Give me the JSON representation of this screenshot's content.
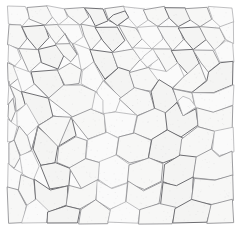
{
  "figure": {
    "kind": "micrograph",
    "name": "grain-structure-micrograph",
    "subject_label": "polycrystalline grain boundary network",
    "width_px": 241,
    "height_px": 234,
    "has_axes": false,
    "has_text_labels": false,
    "has_scale_bar": false,
    "colors": {
      "page_background": "#ffffff",
      "plate_background": "#fbfbfb",
      "cell_interior": "#f7f7f6",
      "cell_interior_pale": "#fafafa",
      "cell_interior_dark": "#f4f4f3",
      "boundary_line": "#8d8d90",
      "boundary_line_pale": "#a6a6a9",
      "boundary_line_dark": "#6e6e72"
    },
    "content_bounds": {
      "left": 8,
      "top": 7,
      "right": 233,
      "bottom": 223
    },
    "margin_px": {
      "left": 8,
      "top": 7,
      "right": 8,
      "bottom": 11
    }
  },
  "chart_data": {
    "type": "heatmap",
    "title": "",
    "subtitle": "",
    "xlabel": "",
    "ylabel": "",
    "grid": false,
    "legend_position": "none",
    "xlim": [
      0,
      241
    ],
    "ylim": [
      0,
      234
    ],
    "cell_count_estimate": 142,
    "mean_cell_diameter_px": 19,
    "boundary_stroke_width_px": 0.85,
    "cells": [
      {
        "tone": "pale",
        "pts": "8,7 26,7 30,18 22,26 9,24"
      },
      {
        "tone": "mid",
        "pts": "26,7 46,6 52,16 44,25 30,18"
      },
      {
        "tone": "pale",
        "pts": "46,6 64,8 68,17 58,24 52,16"
      },
      {
        "tone": "mid",
        "pts": "64,8 84,7 90,16 80,25 68,17"
      },
      {
        "tone": "dark",
        "pts": "84,7 104,8 108,20 96,27 90,16"
      },
      {
        "tone": "mid",
        "pts": "104,8 124,7 128,18 118,26 108,20"
      },
      {
        "tone": "pale",
        "pts": "124,7 144,9 148,20 136,27 128,18"
      },
      {
        "tone": "mid",
        "pts": "144,9 164,7 170,18 158,26 148,20"
      },
      {
        "tone": "dark",
        "pts": "164,7 186,8 190,19 178,27 170,18"
      },
      {
        "tone": "mid",
        "pts": "186,8 208,7 212,19 200,27 190,19"
      },
      {
        "tone": "pale",
        "pts": "208,7 233,8 233,22 220,28 212,19"
      },
      {
        "tone": "mid",
        "pts": "9,24 22,26 26,38 18,48 8,44"
      },
      {
        "tone": "dark",
        "pts": "22,26 44,25 50,38 38,50 26,38"
      },
      {
        "tone": "mid",
        "pts": "44,25 58,24 64,34 56,44 50,38"
      },
      {
        "tone": "pale",
        "pts": "58,24 80,25 84,36 72,44 64,34"
      },
      {
        "tone": "mid",
        "pts": "80,25 96,27 102,40 90,50 84,36"
      },
      {
        "tone": "dark",
        "pts": "96,27 118,26 126,40 112,52 102,40"
      },
      {
        "tone": "mid",
        "pts": "118,26 136,27 142,38 132,48 126,40"
      },
      {
        "tone": "pale",
        "pts": "136,27 158,26 164,38 152,48 142,38"
      },
      {
        "tone": "mid",
        "pts": "158,26 178,27 184,40 172,50 164,38"
      },
      {
        "tone": "dark",
        "pts": "178,27 200,27 206,40 194,50 184,40"
      },
      {
        "tone": "mid",
        "pts": "200,27 220,28 226,40 214,50 206,40"
      },
      {
        "tone": "pale",
        "pts": "220,28 233,22 233,44 226,40"
      },
      {
        "tone": "pale",
        "pts": "8,44 18,48 22,58 14,66 8,62"
      },
      {
        "tone": "mid",
        "pts": "18,48 38,50 42,62 30,72 22,58"
      },
      {
        "tone": "dark",
        "pts": "38,50 56,44 64,56 58,70 42,62"
      },
      {
        "tone": "mid",
        "pts": "56,44 72,44 78,54 70,62 64,56"
      },
      {
        "tone": "pale",
        "pts": "72,44 90,50 94,62 82,70 78,54"
      },
      {
        "tone": "dark",
        "pts": "90,50 112,52 118,68 104,80 94,62"
      },
      {
        "tone": "mid",
        "pts": "112,52 132,48 140,60 130,72 118,68"
      },
      {
        "tone": "pale",
        "pts": "132,48 152,48 158,58 148,68 140,60"
      },
      {
        "tone": "mid",
        "pts": "152,48 172,50 178,62 166,72 158,58"
      },
      {
        "tone": "dark",
        "pts": "172,50 194,50 200,64 188,74 178,62"
      },
      {
        "tone": "mid",
        "pts": "194,50 214,50 220,62 208,72 200,64"
      },
      {
        "tone": "pale",
        "pts": "214,50 226,40 233,44 233,62 220,62"
      },
      {
        "tone": "mid",
        "pts": "8,62 14,66 18,78 10,86 8,80"
      },
      {
        "tone": "pale",
        "pts": "14,66 30,72 34,84 22,92 18,78"
      },
      {
        "tone": "dark",
        "pts": "30,72 58,70 64,86 48,98 34,84"
      },
      {
        "tone": "mid",
        "pts": "58,70 70,62 82,70 80,84 64,86"
      },
      {
        "tone": "pale",
        "pts": "80,84 82,70 94,62 104,80 96,92"
      },
      {
        "tone": "dark",
        "pts": "104,80 118,68 130,72 134,88 120,98"
      },
      {
        "tone": "mid",
        "pts": "130,72 148,68 158,80 150,92 134,88"
      },
      {
        "tone": "pale",
        "pts": "158,80 148,68 166,72 178,62 184,78 172,88"
      },
      {
        "tone": "mid",
        "pts": "172,88 184,78 188,74 200,64 206,80 192,92"
      },
      {
        "tone": "dark",
        "pts": "192,92 206,80 208,72 220,62 233,62 233,84 214,92"
      },
      {
        "tone": "pale",
        "pts": "8,80 10,86 14,98 8,104"
      },
      {
        "tone": "mid",
        "pts": "10,86 22,92 26,104 16,112 14,98"
      },
      {
        "tone": "dark",
        "pts": "22,92 48,98 54,116 38,126 26,104"
      },
      {
        "tone": "mid",
        "pts": "48,98 64,86 80,84 96,92 92,110 72,118"
      },
      {
        "tone": "pale",
        "pts": "96,92 104,80 120,98 116,112 104,114"
      },
      {
        "tone": "mid",
        "pts": "120,98 134,88 150,92 154,108 138,116"
      },
      {
        "tone": "dark",
        "pts": "154,108 150,92 158,80 172,88 178,102 166,114"
      },
      {
        "tone": "mid",
        "pts": "178,102 172,88 192,92 196,108 184,116"
      },
      {
        "tone": "pale",
        "pts": "196,108 192,92 214,92 233,84 233,106 214,112"
      },
      {
        "tone": "mid",
        "pts": "8,104 14,98 16,112 10,122 8,118"
      },
      {
        "tone": "pale",
        "pts": "16,112 26,104 38,126 28,136 18,126"
      },
      {
        "tone": "dark",
        "pts": "38,126 54,116 72,118 76,136 58,146"
      },
      {
        "tone": "mid",
        "pts": "72,118 92,110 104,114 106,132 88,140"
      },
      {
        "tone": "pale",
        "pts": "106,132 104,114 116,112 138,116 134,134 118,138"
      },
      {
        "tone": "mid",
        "pts": "134,134 138,116 154,108 166,114 168,130 152,140"
      },
      {
        "tone": "dark",
        "pts": "168,130 166,114 178,102 184,116 196,108 198,126 182,138"
      },
      {
        "tone": "mid",
        "pts": "198,126 196,108 214,112 233,106 233,128 214,132"
      },
      {
        "tone": "pale",
        "pts": "8,118 10,122 18,126 14,140 8,142"
      },
      {
        "tone": "mid",
        "pts": "18,126 28,136 32,150 20,156 14,140"
      },
      {
        "tone": "dark",
        "pts": "32,150 38,126 58,146 56,162 40,166"
      },
      {
        "tone": "mid",
        "pts": "56,162 58,146 76,136 88,140 86,158 70,168"
      },
      {
        "tone": "pale",
        "pts": "86,158 88,140 106,132 118,138 116,154 100,162"
      },
      {
        "tone": "mid",
        "pts": "116,154 118,138 134,134 152,140 148,158 130,164"
      },
      {
        "tone": "dark",
        "pts": "148,158 152,140 168,130 182,138 180,156 164,164"
      },
      {
        "tone": "mid",
        "pts": "180,156 182,138 198,126 214,132 212,150 196,158"
      },
      {
        "tone": "pale",
        "pts": "212,150 214,132 233,128 233,152 220,156"
      },
      {
        "tone": "mid",
        "pts": "8,142 14,140 20,156 14,168 8,164"
      },
      {
        "tone": "pale",
        "pts": "20,156 32,150 40,166 34,180 22,174"
      },
      {
        "tone": "dark",
        "pts": "40,166 56,162 70,168 68,186 50,190"
      },
      {
        "tone": "mid",
        "pts": "70,168 86,158 100,162 98,180 82,188"
      },
      {
        "tone": "pale",
        "pts": "98,180 100,162 116,154 130,164 128,182 112,188"
      },
      {
        "tone": "mid",
        "pts": "128,182 130,164 148,158 164,164 162,182 144,190"
      },
      {
        "tone": "dark",
        "pts": "162,182 164,164 180,156 196,158 194,178 176,186"
      },
      {
        "tone": "mid",
        "pts": "194,178 196,158 212,150 220,156 233,152 233,176 214,180"
      },
      {
        "tone": "pale",
        "pts": "8,164 14,168 22,174 18,190 8,188"
      },
      {
        "tone": "mid",
        "pts": "22,174 34,180 36,198 26,206 18,190"
      },
      {
        "tone": "dark",
        "pts": "36,198 34,180 50,190 68,186 66,206 48,212"
      },
      {
        "tone": "mid",
        "pts": "66,206 68,186 82,188 98,180 96,200 80,210"
      },
      {
        "tone": "pale",
        "pts": "96,200 98,180 112,188 128,182 126,202 110,210"
      },
      {
        "tone": "mid",
        "pts": "126,202 128,182 144,190 162,182 160,204 140,210"
      },
      {
        "tone": "dark",
        "pts": "160,204 162,182 176,186 194,178 192,200 176,208"
      },
      {
        "tone": "mid",
        "pts": "192,200 194,178 214,180 233,176 233,200 212,204"
      },
      {
        "tone": "mid",
        "pts": "8,188 18,190 26,206 22,223 8,223"
      },
      {
        "tone": "pale",
        "pts": "26,206 36,198 48,212 46,223 22,223"
      },
      {
        "tone": "dark",
        "pts": "48,212 66,206 80,210 78,223 46,223"
      },
      {
        "tone": "mid",
        "pts": "80,210 96,200 110,210 108,223 78,223"
      },
      {
        "tone": "pale",
        "pts": "110,210 126,202 140,210 138,223 108,223"
      },
      {
        "tone": "mid",
        "pts": "140,210 160,204 176,208 172,223 138,223"
      },
      {
        "tone": "dark",
        "pts": "176,208 192,200 212,204 206,223 172,223"
      },
      {
        "tone": "mid",
        "pts": "212,204 233,200 233,223 206,223"
      },
      {
        "tone": "pale",
        "pts": "96,92 92,110 104,114 104,100"
      },
      {
        "tone": "mid",
        "pts": "54,116 38,126 32,150 38,126 58,146 72,118"
      },
      {
        "tone": "pale",
        "pts": "140,60 148,68 158,58 152,48 144,56"
      },
      {
        "tone": "mid",
        "pts": "64,34 70,44 78,54 72,44 68,38"
      },
      {
        "tone": "dark",
        "pts": "108,20 118,26 128,18 124,12 114,14"
      },
      {
        "tone": "pale",
        "pts": "178,102 184,116 196,108 190,98 182,96"
      }
    ]
  }
}
